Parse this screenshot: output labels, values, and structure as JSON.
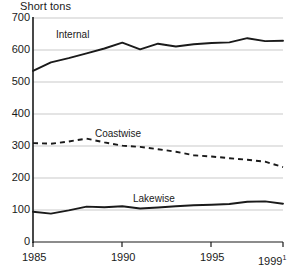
{
  "chart_data": {
    "type": "line",
    "title": "Short tons",
    "xlabel": "",
    "ylabel": "Short tons",
    "xlim": [
      1985,
      1999
    ],
    "ylim": [
      0,
      700
    ],
    "grid": true,
    "legend": "inline-labels",
    "x": [
      1985,
      1986,
      1987,
      1988,
      1989,
      1990,
      1991,
      1992,
      1993,
      1994,
      1995,
      1996,
      1997,
      1998,
      1999
    ],
    "xticks": [
      "1985",
      "1990",
      "1995",
      "1999"
    ],
    "xtick_values": [
      1985,
      1990,
      1995,
      1999
    ],
    "xtick_footnote": "1",
    "yticks": [
      "0",
      "100",
      "200",
      "300",
      "400",
      "500",
      "600",
      "700"
    ],
    "ytick_values": [
      0,
      100,
      200,
      300,
      400,
      500,
      600,
      700
    ],
    "series": [
      {
        "name": "Internal",
        "style": "solid",
        "color": "#1a1a1a",
        "values": [
          535,
          562,
          575,
          590,
          605,
          623,
          602,
          620,
          611,
          618,
          622,
          624,
          637,
          628,
          629
        ]
      },
      {
        "name": "Coastwise",
        "style": "dashed",
        "color": "#1a1a1a",
        "values": [
          310,
          308,
          315,
          324,
          312,
          302,
          298,
          291,
          283,
          272,
          268,
          263,
          258,
          252,
          235
        ]
      },
      {
        "name": "Lakewise",
        "style": "solid",
        "color": "#1a1a1a",
        "values": [
          96,
          90,
          100,
          112,
          110,
          113,
          106,
          109,
          113,
          116,
          118,
          120,
          127,
          128,
          121
        ]
      }
    ],
    "annotations": [
      {
        "text": "Internal",
        "x": 1987.2,
        "y": 660
      },
      {
        "text": "Coastwise",
        "x": 1991.2,
        "y": 348
      },
      {
        "text": "Lakewise",
        "x": 1993.5,
        "y": 152
      }
    ]
  },
  "axes": {
    "y_labels": [
      "700",
      "600",
      "500",
      "400",
      "300",
      "200",
      "100",
      "0"
    ],
    "x_labels": [
      "1985",
      "1990",
      "1995",
      "1999"
    ]
  },
  "colors": {
    "line": "#1a1a1a",
    "grid": "#c9c9c9",
    "axis": "#1a1a1a",
    "background": "#ffffff",
    "text": "#1a1a1a"
  }
}
